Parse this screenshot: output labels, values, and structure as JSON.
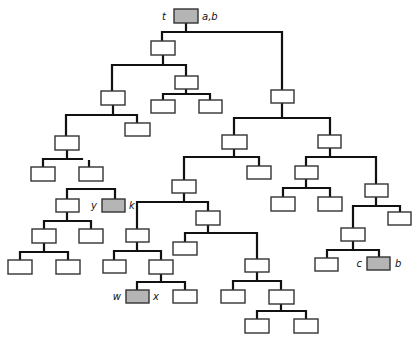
{
  "diagram": {
    "type": "tree",
    "colors": {
      "edge": "#111111",
      "node_fill": "#ffffff",
      "highlight_fill": "#b5b5b5"
    },
    "nodes": [
      {
        "id": "root",
        "x": 174,
        "y": 9,
        "w": 24,
        "h": 14,
        "gray": true
      },
      {
        "id": "n1",
        "x": 151,
        "y": 41,
        "w": 24,
        "h": 14
      },
      {
        "id": "n2",
        "x": 271,
        "y": 90,
        "w": 23,
        "h": 13
      },
      {
        "id": "n3",
        "x": 101,
        "y": 91,
        "w": 24,
        "h": 14
      },
      {
        "id": "n4",
        "x": 175,
        "y": 76,
        "w": 23,
        "h": 13
      },
      {
        "id": "n5",
        "x": 151,
        "y": 100,
        "w": 24,
        "h": 13
      },
      {
        "id": "n6",
        "x": 199,
        "y": 100,
        "w": 23,
        "h": 13
      },
      {
        "id": "n7",
        "x": 55,
        "y": 136,
        "w": 24,
        "h": 14
      },
      {
        "id": "n8",
        "x": 125,
        "y": 123,
        "w": 25,
        "h": 13
      },
      {
        "id": "n9",
        "x": 31,
        "y": 167,
        "w": 24,
        "h": 14
      },
      {
        "id": "n10",
        "x": 79,
        "y": 167,
        "w": 24,
        "h": 14
      },
      {
        "id": "n11",
        "x": 56,
        "y": 199,
        "w": 23,
        "h": 13
      },
      {
        "id": "n12",
        "x": 102,
        "y": 199,
        "w": 23,
        "h": 13,
        "gray": true
      },
      {
        "id": "n13",
        "x": 32,
        "y": 229,
        "w": 24,
        "h": 14
      },
      {
        "id": "n14",
        "x": 79,
        "y": 229,
        "w": 24,
        "h": 14
      },
      {
        "id": "n15",
        "x": 8,
        "y": 260,
        "w": 24,
        "h": 14
      },
      {
        "id": "n16",
        "x": 56,
        "y": 260,
        "w": 24,
        "h": 14
      },
      {
        "id": "n17",
        "x": 222,
        "y": 135,
        "w": 25,
        "h": 14
      },
      {
        "id": "n18",
        "x": 318,
        "y": 135,
        "w": 23,
        "h": 13
      },
      {
        "id": "n19",
        "x": 172,
        "y": 180,
        "w": 24,
        "h": 13
      },
      {
        "id": "n20",
        "x": 247,
        "y": 166,
        "w": 24,
        "h": 13
      },
      {
        "id": "n21",
        "x": 126,
        "y": 229,
        "w": 23,
        "h": 13
      },
      {
        "id": "n22",
        "x": 196,
        "y": 211,
        "w": 24,
        "h": 14
      },
      {
        "id": "n23",
        "x": 103,
        "y": 260,
        "w": 23,
        "h": 13
      },
      {
        "id": "n24",
        "x": 149,
        "y": 260,
        "w": 24,
        "h": 14
      },
      {
        "id": "n25",
        "x": 126,
        "y": 290,
        "w": 23,
        "h": 13,
        "gray": true
      },
      {
        "id": "n26",
        "x": 173,
        "y": 290,
        "w": 24,
        "h": 13
      },
      {
        "id": "n27",
        "x": 173,
        "y": 242,
        "w": 24,
        "h": 13
      },
      {
        "id": "n28",
        "x": 245,
        "y": 259,
        "w": 24,
        "h": 13
      },
      {
        "id": "n29",
        "x": 221,
        "y": 290,
        "w": 24,
        "h": 13
      },
      {
        "id": "n30",
        "x": 269,
        "y": 290,
        "w": 25,
        "h": 14
      },
      {
        "id": "n31",
        "x": 245,
        "y": 319,
        "w": 24,
        "h": 14
      },
      {
        "id": "n32",
        "x": 294,
        "y": 319,
        "w": 24,
        "h": 14
      },
      {
        "id": "n33",
        "x": 295,
        "y": 166,
        "w": 23,
        "h": 13
      },
      {
        "id": "n34",
        "x": 365,
        "y": 184,
        "w": 23,
        "h": 13
      },
      {
        "id": "n35",
        "x": 271,
        "y": 197,
        "w": 24,
        "h": 14
      },
      {
        "id": "n36",
        "x": 318,
        "y": 197,
        "w": 24,
        "h": 14
      },
      {
        "id": "n37",
        "x": 341,
        "y": 228,
        "w": 24,
        "h": 13
      },
      {
        "id": "n38",
        "x": 388,
        "y": 212,
        "w": 23,
        "h": 13
      },
      {
        "id": "n39",
        "x": 315,
        "y": 258,
        "w": 23,
        "h": 13
      },
      {
        "id": "n40",
        "x": 367,
        "y": 257,
        "w": 23,
        "h": 13,
        "gray": true
      }
    ],
    "edges": [
      "M186 23 V32 M162 32 H282 M162 32 V41 M282 32 V90",
      "M163 55 V65 M112 65 H186 M112 65 V91 M186 65 V76",
      "M186 89 V94 M163 94 H210 M163 94 V100 M210 94 V100",
      "M113 105 V115 M66 115 H137 M66 115 V136 M137 115 V123",
      "M67 150 V159 M43 159 H82 M43 159 V167 M89 161 V167",
      "M67 189 H115 M67 189 V199 M115 189 V199",
      "M67 212 V221 M44 221 H91 M44 221 V229 M91 221 V229",
      "M44 243 V252 M20 252 H68 M20 252 V260 M68 252 V260",
      "M282 103 V118 M234 118 H330 M234 118 V135 M330 118 V135",
      "M234 149 V157 M184 157 H259 M184 157 V180 M259 157 V166",
      "M184 193 V202 M137 202 H208 M137 202 V229 M208 202 V211",
      "M137 242 V251 M114 251 H161 M114 251 V260 M161 251 V260",
      "M161 274 V282 M137 282 H185 M137 282 V290 M185 282 V290",
      "M208 225 V233 M185 233 H257 M185 233 V242 M257 233 V259",
      "M257 272 V281 M233 281 H281 M233 281 V290 M281 281 V290",
      "M281 304 V311 M257 311 H306 M257 311 V319 M306 311 V319",
      "M330 148 V157 M306 157 H376 M306 157 V166 M376 157 V184",
      "M306 179 V188 M283 188 H330 M283 188 V197 M330 188 V197",
      "M376 197 V206 M353 206 H400 M353 206 V228 M400 206 V212",
      "M353 241 V250 M327 250 H379 M327 250 V258 M379 250 V257"
    ],
    "labels": [
      {
        "text": "t",
        "x": 166,
        "y": 20,
        "anchor": "end"
      },
      {
        "text": "a,b",
        "x": 202,
        "y": 20,
        "anchor": "start"
      },
      {
        "text": "y",
        "x": 97,
        "y": 209,
        "anchor": "end"
      },
      {
        "text": "k",
        "x": 129,
        "y": 209,
        "anchor": "start"
      },
      {
        "text": "w",
        "x": 121,
        "y": 300,
        "anchor": "end"
      },
      {
        "text": "x",
        "x": 153,
        "y": 300,
        "anchor": "start"
      },
      {
        "text": "c",
        "x": 362,
        "y": 267,
        "anchor": "end"
      },
      {
        "text": "b",
        "x": 395,
        "y": 267,
        "anchor": "start"
      }
    ]
  }
}
